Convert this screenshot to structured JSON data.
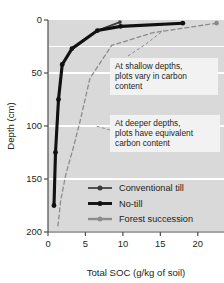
{
  "chart_data": {
    "type": "line",
    "title": "",
    "xlabel": "Total SOC (g/kg of soil)",
    "ylabel": "Depth (cm)",
    "xlim": [
      0,
      23.5
    ],
    "ylim": [
      200,
      0
    ],
    "y_inverted": true,
    "xticks": [
      0,
      5,
      10,
      15,
      20
    ],
    "yticks": [
      0,
      50,
      100,
      150,
      200
    ],
    "xticklabels": [
      "0",
      "5",
      "10",
      "15",
      "20"
    ],
    "yticklabels": [
      "0",
      "50",
      "100",
      "150",
      "200"
    ],
    "grid": "horizontal-white",
    "plot_bgcolor": "#d9d9d9",
    "legend_position": "lower-right-inside",
    "series": [
      {
        "name": "Conventional till",
        "color": "#3b3b3b",
        "style": "solid",
        "marker": "circle",
        "points": [
          {
            "x": 9.6,
            "y": 2
          },
          {
            "x": 6.6,
            "y": 10
          },
          {
            "x": 3.2,
            "y": 27
          },
          {
            "x": 1.9,
            "y": 42
          },
          {
            "x": 1.4,
            "y": 75
          },
          {
            "x": 1.0,
            "y": 125
          },
          {
            "x": 0.8,
            "y": 175
          }
        ]
      },
      {
        "name": "No-till",
        "color": "#111111",
        "style": "solid",
        "marker": "circle",
        "points": [
          {
            "x": 18.0,
            "y": 3
          },
          {
            "x": 9.7,
            "y": 6
          },
          {
            "x": 6.6,
            "y": 10
          },
          {
            "x": 3.2,
            "y": 27
          },
          {
            "x": 1.9,
            "y": 42
          },
          {
            "x": 1.4,
            "y": 75
          },
          {
            "x": 1.0,
            "y": 125
          },
          {
            "x": 0.8,
            "y": 175
          }
        ]
      },
      {
        "name": "Forest succession",
        "color": "#8c8c8c",
        "style": "dashed",
        "marker": "circle",
        "points": [
          {
            "x": 22.5,
            "y": 3
          },
          {
            "x": 14.0,
            "y": 12
          },
          {
            "x": 8.5,
            "y": 24
          },
          {
            "x": 5.6,
            "y": 55
          },
          {
            "x": 4.3,
            "y": 95
          },
          {
            "x": 3.4,
            "y": 120
          },
          {
            "x": 2.4,
            "y": 145
          },
          {
            "x": 1.7,
            "y": 170
          },
          {
            "x": 1.3,
            "y": 196
          }
        ]
      }
    ],
    "annotations": [
      {
        "id": "shallow",
        "text": "At shallow depths, plots vary in carbon content",
        "lines": [
          "At shallow depths,",
          "plots vary in carbon",
          "content"
        ]
      },
      {
        "id": "deep",
        "text": "At deeper depths, plots have equivalent carbon content",
        "lines": [
          "At deeper depths,",
          "plots have equivalent",
          "carbon content"
        ]
      }
    ],
    "legend": [
      {
        "label": "Conventional till",
        "color": "#3b3b3b",
        "weight": 1.7
      },
      {
        "label": "No-till",
        "color": "#111111",
        "weight": 2.9
      },
      {
        "label": "Forest succession",
        "color": "#8c8c8c",
        "weight": 2.4
      }
    ]
  }
}
